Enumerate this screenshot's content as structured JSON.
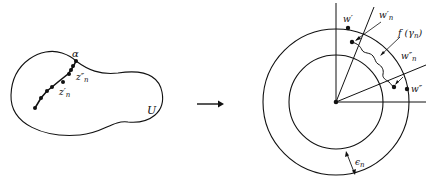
{
  "left_figure": {
    "region_label": "U",
    "boundary_point_label": "α",
    "point_labels": {
      "z_n_prime": "z′",
      "z_n_prime_sub": "n",
      "z_n_double": "z″",
      "z_n_double_sub": "n"
    }
  },
  "mapping_arrow": "→",
  "right_figure": {
    "labels": {
      "w_prime": "w′",
      "w_n_prime": "w′",
      "w_n_prime_sub": "n",
      "f_gamma": "f (γ",
      "f_gamma_sub": "n",
      "f_gamma_close": ")",
      "w_n_double": "w″",
      "w_n_double_sub": "n",
      "w_double": "w″",
      "epsilon": "ϵ",
      "epsilon_sub": "n"
    }
  },
  "colors": {
    "stroke": "#111111",
    "background": "#ffffff"
  }
}
